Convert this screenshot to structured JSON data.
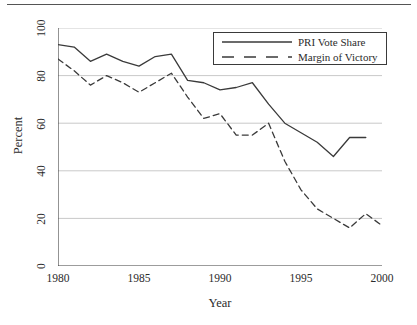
{
  "chart_data": {
    "type": "line",
    "title": "",
    "xlabel": "Year",
    "ylabel": "Percent",
    "xlim": [
      1980,
      2000
    ],
    "ylim": [
      0,
      100
    ],
    "xticks": [
      "1980",
      "1985",
      "1990",
      "1995",
      "2000"
    ],
    "xtick_values": [
      1980,
      1985,
      1990,
      1995,
      2000
    ],
    "yticks": [
      "0",
      "20",
      "40",
      "60",
      "80",
      "100"
    ],
    "ytick_values": [
      0,
      20,
      40,
      60,
      80,
      100
    ],
    "grid": "horizontal",
    "legend_position": "top-right",
    "x": [
      1980,
      1981,
      1982,
      1983,
      1984,
      1985,
      1986,
      1987,
      1988,
      1989,
      1990,
      1991,
      1992,
      1993,
      1994,
      1995,
      1996,
      1997,
      1998,
      1999,
      2000
    ],
    "series": [
      {
        "name": "PRI  Vote Share",
        "style": "solid",
        "color": "#3a3a3a",
        "x": [
          1980,
          1981,
          1982,
          1983,
          1984,
          1985,
          1986,
          1987,
          1988,
          1989,
          1990,
          1991,
          1992,
          1993,
          1994,
          1995,
          1996,
          1997,
          1998,
          1999
        ],
        "values": [
          93,
          92,
          86,
          89,
          86,
          84,
          88,
          89,
          78,
          77,
          74,
          75,
          77,
          68,
          60,
          56,
          52,
          46,
          54,
          54
        ]
      },
      {
        "name": "Margin of Victory",
        "style": "dashed",
        "color": "#3a3a3a",
        "x": [
          1980,
          1981,
          1982,
          1983,
          1984,
          1985,
          1986,
          1987,
          1988,
          1989,
          1990,
          1991,
          1992,
          1993,
          1994,
          1995,
          1996,
          1997,
          1998,
          1999,
          2000
        ],
        "values": [
          87,
          82,
          76,
          80,
          77,
          73,
          77,
          81,
          71,
          62,
          64,
          55,
          55,
          60,
          44,
          32,
          24,
          20,
          16,
          22,
          17
        ]
      }
    ]
  },
  "legend": {
    "entries": [
      {
        "label": "PRI  Vote Share"
      },
      {
        "label": "Margin of Victory"
      }
    ]
  },
  "axes": {
    "x_title": "Year",
    "y_title": "Percent",
    "x_ticks": [
      "1980",
      "1985",
      "1990",
      "1995",
      "2000"
    ],
    "y_ticks": [
      "100",
      "80",
      "60",
      "40",
      "20",
      "0"
    ]
  }
}
